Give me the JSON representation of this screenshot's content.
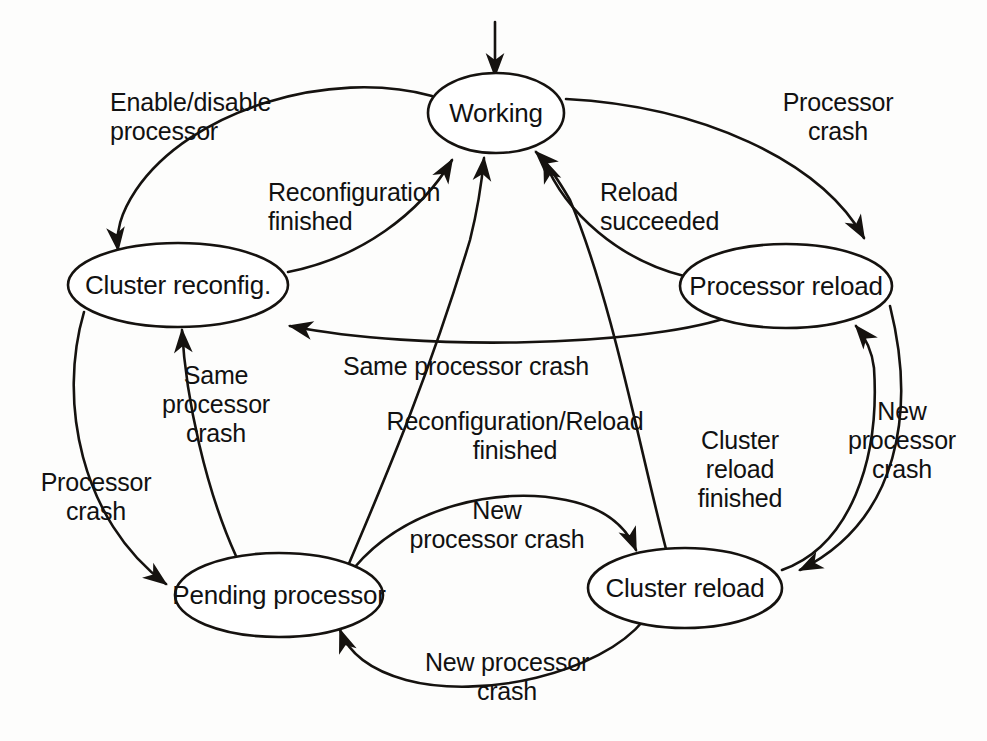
{
  "diagram": {
    "type": "state-transition-diagram",
    "canvas": {
      "width": 987,
      "height": 741
    },
    "style": {
      "background": "#fdfdfc",
      "stroke": "#15120f",
      "node_fill": "#ffffff",
      "text": "#111111"
    },
    "start": {
      "name": "initial-state-marker",
      "target": "working",
      "arrow_from": {
        "x": 495,
        "y": 22
      },
      "arrow_to": {
        "x": 495,
        "y": 76
      }
    },
    "nodes": [
      {
        "id": "working",
        "name": "state-working",
        "label": "Working",
        "lines": [
          "Working"
        ],
        "cx": 496,
        "cy": 113,
        "rx": 68,
        "ry": 40
      },
      {
        "id": "cluster_reconfig",
        "name": "state-cluster-reconfig",
        "label": "Cluster reconfig.",
        "lines": [
          "Cluster",
          "reconfig."
        ],
        "cx": 178,
        "cy": 285,
        "rx": 110,
        "ry": 42
      },
      {
        "id": "processor_reload",
        "name": "state-processor-reload",
        "label": "Processor reload",
        "lines": [
          "Processor",
          "reload"
        ],
        "cx": 786,
        "cy": 286,
        "rx": 106,
        "ry": 42
      },
      {
        "id": "pending_processor",
        "name": "state-pending-processor",
        "label": "Pending processor",
        "lines": [
          "Pending",
          "processor"
        ],
        "cx": 279,
        "cy": 595,
        "rx": 104,
        "ry": 42
      },
      {
        "id": "cluster_reload",
        "name": "state-cluster-reload",
        "label": "Cluster reload",
        "lines": [
          "Cluster",
          "reload"
        ],
        "cx": 685,
        "cy": 588,
        "rx": 97,
        "ry": 40
      }
    ],
    "edges": [
      {
        "id": "e1",
        "name": "edge-working-to-cluster-reconfig",
        "from": "working",
        "to": "cluster_reconfig",
        "label": "Enable/disable processor",
        "lines": [
          "Enable/disable",
          "processor"
        ],
        "label_x": 110,
        "label_y": 117,
        "label_align": "l",
        "path": "M 432 96 C 330 68 190 110 136 190 C 120 214 116 232 118 250"
      },
      {
        "id": "e2",
        "name": "edge-cluster-reconfig-to-working",
        "from": "cluster_reconfig",
        "to": "working",
        "label": "Reconfiguration finished",
        "lines": [
          "Reconfiguration",
          "finished"
        ],
        "label_x": 268,
        "label_y": 207,
        "label_align": "l",
        "path": "M 288 272 C 360 258 420 214 452 160"
      },
      {
        "id": "e3",
        "name": "edge-working-to-processor-reload",
        "from": "working",
        "to": "processor_reload",
        "label": "Processor crash",
        "lines": [
          "Processor",
          "crash"
        ],
        "label_x": 838,
        "label_y": 117,
        "label_align": "c",
        "path": "M 566 99 C 700 106 820 160 864 238"
      },
      {
        "id": "e4",
        "name": "edge-processor-reload-to-working",
        "from": "processor_reload",
        "to": "working",
        "label": "Reload succeeded",
        "lines": [
          "Reload",
          "succeeded"
        ],
        "label_x": 600,
        "label_y": 207,
        "label_align": "l",
        "path": "M 684 276 C 620 260 566 214 544 160"
      },
      {
        "id": "e5",
        "name": "edge-processor-reload-to-cluster-reconfig",
        "from": "processor_reload",
        "to": "cluster_reconfig",
        "label": "Same processor crash",
        "lines": [
          "Same processor crash"
        ],
        "label_x": 466,
        "label_y": 366,
        "label_align": "c",
        "path": "M 726 318 C 640 346 420 352 290 326"
      },
      {
        "id": "e6",
        "name": "edge-pending-processor-to-cluster-reconfig",
        "from": "pending_processor",
        "to": "cluster_reconfig",
        "label": "Same processor crash",
        "lines": [
          "Same",
          "processor",
          "crash"
        ],
        "label_x": 216,
        "label_y": 404,
        "label_align": "c",
        "path": "M 236 556 C 206 490 186 400 182 330"
      },
      {
        "id": "e7",
        "name": "edge-cluster-reconfig-to-pending-processor",
        "from": "cluster_reconfig",
        "to": "pending_processor",
        "label": "Processor crash",
        "lines": [
          "Processor",
          "crash"
        ],
        "label_x": 96,
        "label_y": 497,
        "label_align": "c",
        "path": "M 84 312 C 58 400 80 520 166 584"
      },
      {
        "id": "e8",
        "name": "edge-pending-processor-to-working",
        "from": "pending_processor",
        "to": "working",
        "label": "Reconfiguration/Reload finished",
        "lines": [
          "Reconfiguration/Reload",
          "finished"
        ],
        "label_x": 515,
        "label_y": 436,
        "label_align": "c",
        "path": "M 348 566 C 380 490 428 380 470 240 C 478 208 482 180 484 158"
      },
      {
        "id": "e9",
        "name": "edge-cluster-reload-to-working",
        "from": "cluster_reload",
        "to": "working",
        "label": "Cluster reload finished",
        "lines": [
          "Cluster",
          "reload",
          "finished"
        ],
        "label_x": 740,
        "label_y": 469,
        "label_align": "c",
        "path": "M 666 549 C 640 450 612 300 570 200 C 556 176 546 162 536 152"
      },
      {
        "id": "e10",
        "name": "edge-cluster-reload-to-processor-reload",
        "from": "cluster_reload",
        "to": "processor_reload",
        "label": "New processor crash",
        "lines": [
          "New",
          "processor",
          "crash"
        ],
        "label_x": 902,
        "label_y": 440,
        "label_align": "c",
        "path": "M 782 570 C 850 546 880 460 874 368 C 872 350 866 338 856 326"
      },
      {
        "id": "e11",
        "name": "edge-processor-reload-to-cluster-reload",
        "from": "processor_reload",
        "to": "cluster_reload",
        "label": "",
        "lines": [],
        "label_x": 0,
        "label_y": 0,
        "label_align": "c",
        "path": "M 890 306 C 916 410 900 520 800 570"
      },
      {
        "id": "e12",
        "name": "edge-pending-processor-to-cluster-reload",
        "from": "pending_processor",
        "to": "cluster_reload",
        "label": "New processor crash",
        "lines": [
          "New",
          "processor crash"
        ],
        "label_x": 497,
        "label_y": 525,
        "label_align": "c",
        "path": "M 354 568 C 406 506 500 486 566 500 C 606 508 626 526 636 550"
      },
      {
        "id": "e13",
        "name": "edge-cluster-reload-to-pending-processor",
        "from": "cluster_reload",
        "to": "pending_processor",
        "label": "New processor crash",
        "lines": [
          "New processor",
          "crash"
        ],
        "label_x": 507,
        "label_y": 677,
        "label_align": "c",
        "path": "M 644 620 C 600 674 480 700 406 680 C 370 670 348 652 340 630"
      }
    ]
  }
}
